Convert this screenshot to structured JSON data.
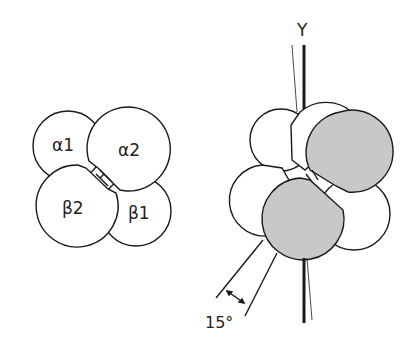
{
  "left_diagram": {
    "subunits": [
      {
        "id": "alpha1",
        "label": "α1"
      },
      {
        "id": "alpha2",
        "label": "α2"
      },
      {
        "id": "beta2",
        "label": "β2"
      },
      {
        "id": "beta1",
        "label": "β1"
      }
    ]
  },
  "right_diagram": {
    "axis_label": "Y",
    "angle_label": "15°",
    "colors": {
      "shaded": "#c8c8c8",
      "outline": "#1a1a1a",
      "fill": "#ffffff"
    }
  }
}
